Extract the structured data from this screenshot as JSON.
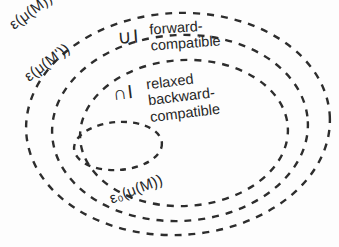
{
  "figure": {
    "background_color": "#fdfdfd",
    "stroke_color": "#2d2d2d"
  },
  "sets": [
    {
      "id": "outer",
      "label": "ε(μ(M))",
      "description": "outermost dashed ellipse"
    },
    {
      "id": "middle",
      "label": "ε(μ(M'))",
      "description": "second dashed ellipse"
    },
    {
      "id": "third",
      "label": "",
      "description": "third dashed ellipse, unlabelled boundary"
    },
    {
      "id": "inner",
      "label": "ε₀(μ(M))",
      "description": "innermost small dashed ellipse"
    }
  ],
  "regions": [
    {
      "id": "forward",
      "operator": "∪I",
      "caption_line1": "forward-",
      "caption_line2": "compatible"
    },
    {
      "id": "backward",
      "operator": "∩I",
      "caption_line1": "relaxed",
      "caption_line2": "backward-",
      "caption_line3": "compatible"
    }
  ],
  "bleed_text": {
    "top": "             ",
    "mid1": "        ",
    "mid2": "        ",
    "mid3": "        ",
    "bottom": "        "
  }
}
